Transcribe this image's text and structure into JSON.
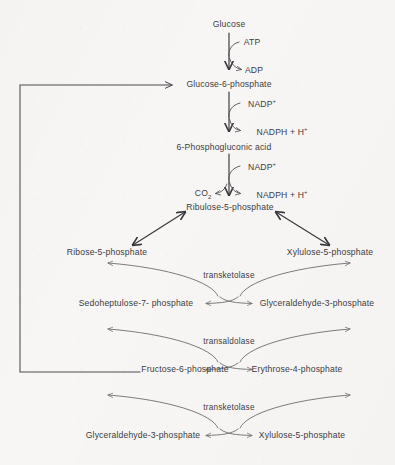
{
  "diagram": {
    "ink_color": "#3d3c3e",
    "paper_color": "#f7f6f4"
  },
  "metabolites": {
    "glucose": "Glucose",
    "glucose_6_phosphate": "Glucose-6-phosphate",
    "phosphogluconic_acid": "6-Phosphogluconic acid",
    "ribulose_5_phosphate": "Ribulose-5-phosphate",
    "ribose_5_phosphate": "Ribose-5-phosphate",
    "xylulose_5_phosphate_top": "Xylulose-5-phosphate",
    "sedoheptulose_7_phosphate": "Sedoheptulose-7- phosphate",
    "glyceraldehyde_3_phosphate_mid": "Glyceraldehyde-3-phosphate",
    "fructose_6_phosphate": "Fructose-6-phosphate",
    "erythrose_4_phosphate": "Erythrose-4-phosphate",
    "glyceraldehyde_3_phosphate_bottom": "Glyceraldehyde-3-phosphate",
    "xylulose_5_phosphate_bottom": "Xylulose-5-phosphate"
  },
  "cofactors": {
    "atp": "ATP",
    "adp": "ADP",
    "nadp_plus_first": "NADP",
    "nadp_plus_first_charge": "+",
    "nadph_first": "NADPH + H",
    "nadph_first_charge": "+",
    "nadp_plus_second": "NADP",
    "nadp_plus_second_charge": "+",
    "nadph_second": "NADPH + H",
    "nadph_second_charge": "+",
    "co2": "CO",
    "co2_subscript": "2"
  },
  "enzymes": {
    "transketolase_upper": "transketolase",
    "transaldolase": "transaldolase",
    "transketolase_lower": "transketolase"
  }
}
